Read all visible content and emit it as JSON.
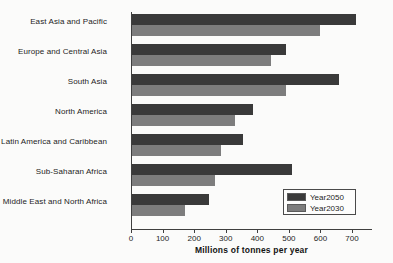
{
  "chart_data": {
    "type": "bar",
    "orientation": "horizontal",
    "title": "",
    "xlabel": "Millions of tonnes per year",
    "ylabel": "",
    "xlim": [
      0,
      760
    ],
    "xticks": [
      0,
      100,
      200,
      300,
      400,
      500,
      600,
      700
    ],
    "grid": false,
    "legend_position": "bottom-right",
    "categories": [
      "East Asia and Pacific",
      "Europe and Central Asia",
      "South Asia",
      "North America",
      "Latin America and Caribbean",
      "Sub-Saharan Africa",
      "Middle East and North Africa"
    ],
    "series": [
      {
        "name": "Year2050",
        "color": "#3a3a3a",
        "values": [
          714,
          490,
          660,
          386,
          355,
          510,
          247
        ]
      },
      {
        "name": "Year2030",
        "color": "#7d7d7d",
        "values": [
          600,
          442,
          490,
          330,
          285,
          265,
          172
        ]
      }
    ]
  },
  "legend": {
    "entries": [
      {
        "label": "Year2050",
        "color": "#3a3a3a"
      },
      {
        "label": "Year2030",
        "color": "#7d7d7d"
      }
    ]
  },
  "axis": {
    "x_title": "Millions of tonnes per year",
    "tick_labels": [
      "0",
      "100",
      "200",
      "300",
      "400",
      "500",
      "600",
      "700"
    ]
  }
}
